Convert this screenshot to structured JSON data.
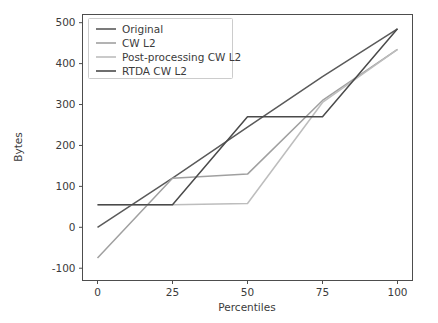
{
  "chart_data": {
    "type": "line",
    "title": "",
    "xlabel": "Percentiles",
    "ylabel": "Bytes",
    "xlim": [
      -5,
      105
    ],
    "ylim": [
      -130,
      520
    ],
    "xticks": [
      0,
      25,
      50,
      75,
      100
    ],
    "xtick_labels": [
      "0",
      "25",
      "50",
      "75",
      "100"
    ],
    "yticks": [
      -100,
      0,
      100,
      200,
      300,
      400,
      500
    ],
    "ytick_labels": [
      "-100",
      "0",
      "100",
      "200",
      "300",
      "400",
      "500"
    ],
    "grid": false,
    "legend_position": "upper left",
    "x": [
      0,
      25,
      50,
      75,
      100
    ],
    "series": [
      {
        "name": "Original",
        "color": "#5a5a5a",
        "values": [
          0,
          120,
          245,
          368,
          485
        ]
      },
      {
        "name": "CW L2",
        "color": "#a0a0a0",
        "values": [
          -75,
          120,
          130,
          310,
          435
        ]
      },
      {
        "name": "Post-processing CW L2",
        "color": "#bdbdbd",
        "values": [
          55,
          55,
          58,
          305,
          435
        ]
      },
      {
        "name": "RTDA CW L2",
        "color": "#4a4a4a",
        "values": [
          55,
          55,
          270,
          270,
          485
        ]
      }
    ]
  },
  "legend": {
    "entries": [
      {
        "label": "Original"
      },
      {
        "label": "CW L2"
      },
      {
        "label": "Post-processing CW L2"
      },
      {
        "label": "RTDA CW L2"
      }
    ]
  },
  "axes": {
    "xlabel": "Percentiles",
    "ylabel": "Bytes"
  }
}
